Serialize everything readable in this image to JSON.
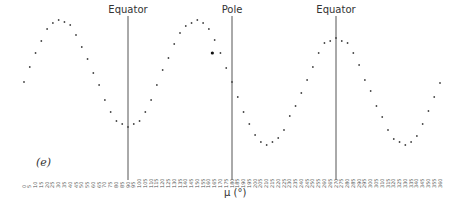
{
  "chart_data": {
    "type": "scatter",
    "title": "",
    "panel_label": "(e)",
    "xlabel": "μ (°)",
    "ylabel": "",
    "xlim": [
      0,
      360
    ],
    "x_ticks": [
      0,
      5,
      10,
      15,
      20,
      25,
      30,
      35,
      40,
      45,
      50,
      55,
      60,
      65,
      70,
      75,
      80,
      85,
      90,
      95,
      100,
      105,
      110,
      115,
      120,
      125,
      130,
      135,
      140,
      145,
      150,
      155,
      160,
      165,
      170,
      175,
      180,
      185,
      190,
      195,
      200,
      205,
      210,
      215,
      220,
      225,
      230,
      235,
      240,
      245,
      250,
      255,
      260,
      265,
      270,
      275,
      280,
      285,
      290,
      295,
      300,
      305,
      310,
      315,
      320,
      325,
      330,
      335,
      340,
      345,
      350,
      355,
      360
    ],
    "grid": false,
    "legend": null,
    "reference_lines": [
      {
        "x": 90,
        "label": "Equator"
      },
      {
        "x": 180,
        "label": "Pole"
      },
      {
        "x": 270,
        "label": "Equator"
      }
    ],
    "series": [
      {
        "name": "data",
        "note": "y values are relative heights (unlabeled y-axis), 0 = lowest point, 125 = highest point",
        "x": [
          0,
          5,
          10,
          15,
          20,
          25,
          30,
          35,
          40,
          45,
          50,
          55,
          60,
          65,
          70,
          75,
          80,
          85,
          90,
          95,
          100,
          105,
          110,
          115,
          120,
          125,
          130,
          135,
          140,
          145,
          150,
          155,
          160,
          165,
          170,
          175,
          180,
          185,
          190,
          195,
          200,
          205,
          210,
          215,
          220,
          225,
          230,
          235,
          240,
          245,
          250,
          255,
          260,
          265,
          270,
          275,
          280,
          285,
          290,
          295,
          300,
          305,
          310,
          315,
          320,
          325,
          330,
          335,
          340,
          345,
          350,
          355,
          360
        ],
        "y": [
          63,
          78,
          92,
          104,
          116,
          122,
          125,
          123,
          120,
          110,
          98,
          86,
          72,
          60,
          45,
          33,
          24,
          21,
          18,
          21,
          24,
          33,
          45,
          60,
          75,
          87,
          101,
          112,
          119,
          122,
          125,
          122,
          116,
          105,
          92,
          77,
          63,
          48,
          33,
          21,
          10,
          3,
          0,
          3,
          7,
          15,
          29,
          39,
          52,
          65,
          78,
          92,
          102,
          104,
          107,
          104,
          102,
          92,
          80,
          65,
          54,
          39,
          28,
          15,
          6,
          3,
          0,
          3,
          9,
          21,
          34,
          48,
          62
        ]
      }
    ],
    "highlighted_point": {
      "x": 163,
      "y": 92
    }
  }
}
